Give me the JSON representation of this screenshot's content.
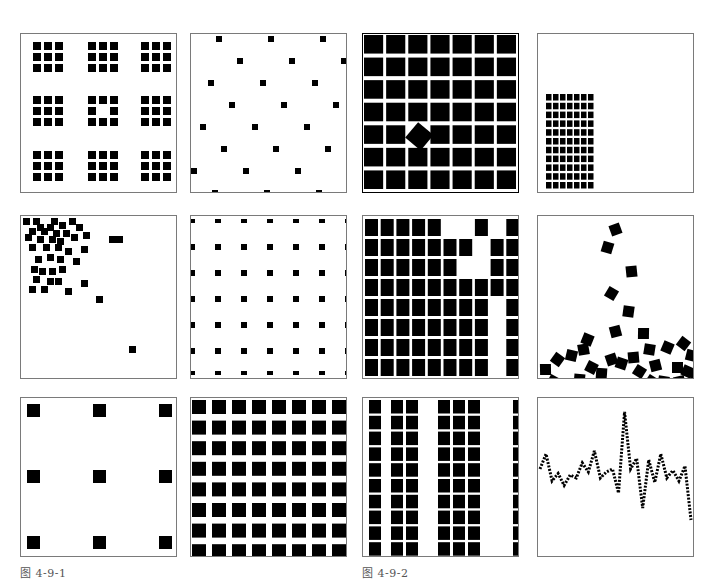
{
  "figure": {
    "ink_color": "#000000",
    "frame_color": "#7a7a7a",
    "captions": [
      "图 4-9-1",
      "图 4-9-2"
    ],
    "panels": [
      {
        "id": "p1",
        "name": "clustered-3x3-grid-with-missing-center",
        "groups_rows": 3,
        "groups_cols": 3,
        "cells_per_group": 3,
        "hollow_center_group": true
      },
      {
        "id": "p2",
        "name": "staggered-dot-lattice",
        "rows": 8,
        "cols": 3,
        "stagger": true
      },
      {
        "id": "p3",
        "name": "dense-grid-with-rotated-square",
        "rows": 7,
        "cols": 7,
        "rotated_cell": {
          "row": 4,
          "col": 2
        }
      },
      {
        "id": "p4",
        "name": "small-block-in-corner",
        "rows": 11,
        "cols": 7
      },
      {
        "id": "p5",
        "name": "scattered-cluster-top-left",
        "count": 40
      },
      {
        "id": "p6",
        "name": "regular-dot-lattice",
        "rows": 7,
        "cols": 7
      },
      {
        "id": "p7",
        "name": "grid-with-gaps",
        "rows": 8,
        "cols": 10,
        "missing": [
          [
            0,
            5
          ],
          [
            0,
            6
          ],
          [
            0,
            8
          ],
          [
            1,
            7
          ],
          [
            2,
            7
          ],
          [
            2,
            6
          ],
          [
            4,
            8
          ],
          [
            5,
            8
          ],
          [
            6,
            8
          ],
          [
            7,
            8
          ]
        ]
      },
      {
        "id": "p8",
        "name": "falling-rotated-squares",
        "count": 34
      },
      {
        "id": "p9",
        "name": "sparse-3x3-grid",
        "rows": 3,
        "cols": 3
      },
      {
        "id": "p10",
        "name": "dense-8x8-grid",
        "rows": 8,
        "cols": 8
      },
      {
        "id": "p11",
        "name": "column-stripes",
        "rows": 10,
        "columns_filled": [
          0,
          2,
          3,
          5,
          6,
          7,
          10
        ]
      },
      {
        "id": "p12",
        "name": "dotted-line-graph",
        "values": [
          0.58,
          0.68,
          0.5,
          0.55,
          0.47,
          0.54,
          0.52,
          0.62,
          0.56,
          0.7,
          0.52,
          0.56,
          0.58,
          0.42,
          0.96,
          0.58,
          0.65,
          0.32,
          0.64,
          0.49,
          0.68,
          0.52,
          0.57,
          0.5,
          0.6,
          0.24
        ]
      }
    ]
  }
}
